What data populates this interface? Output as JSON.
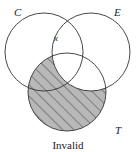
{
  "diagram": {
    "type": "venn",
    "circles": [
      {
        "id": "C",
        "label": "C",
        "cx": 44,
        "cy": 52,
        "r": 39
      },
      {
        "id": "E",
        "label": "E",
        "cx": 91,
        "cy": 52,
        "r": 39
      },
      {
        "id": "T",
        "label": "T",
        "cx": 67,
        "cy": 92,
        "r": 39
      }
    ],
    "labels": {
      "C": "C",
      "E": "E",
      "T": "T",
      "x_mark": "x"
    },
    "shaded_region": "T minus E",
    "caption": "Invalid",
    "colors": {
      "stroke": "#333333",
      "shade_fill": "#b8b8b8",
      "hatch": "#444444",
      "background": "#ffffff"
    }
  }
}
